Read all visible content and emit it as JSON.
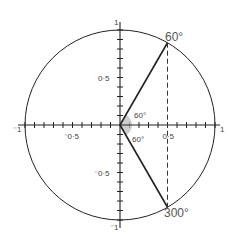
{
  "diagram": {
    "type": "unit-circle",
    "colors": {
      "line": "#222222",
      "label": "#555555",
      "angle_fill": "#bdbdbd",
      "background": "#ffffff"
    },
    "axes": {
      "x_ticks_step": 0.1,
      "y_ticks_step": 0.1,
      "x_labels": [
        {
          "value": -1,
          "text": "⁻1"
        },
        {
          "value": -0.5,
          "text": "⁻0·5"
        },
        {
          "value": 0.5,
          "text": "0·5"
        },
        {
          "value": 1,
          "text": "1"
        }
      ],
      "y_labels": [
        {
          "value": 1,
          "text": "1"
        },
        {
          "value": 0.5,
          "text": "0·5"
        },
        {
          "value": -0.5,
          "text": "⁻0·5"
        },
        {
          "value": -1,
          "text": "⁻1"
        }
      ]
    },
    "points": [
      {
        "angle_deg": 60,
        "label": "60°",
        "x": 0.5,
        "y": 0.866
      },
      {
        "angle_deg": 300,
        "label": "300°",
        "x": 0.5,
        "y": -0.866
      }
    ],
    "angle_marks": [
      {
        "label": "60°",
        "position": "above-x-axis"
      },
      {
        "label": "60°",
        "position": "below-x-axis"
      }
    ],
    "dashed_line": {
      "x": 0.5,
      "from_y": 0.866,
      "to_y": -0.866
    }
  }
}
